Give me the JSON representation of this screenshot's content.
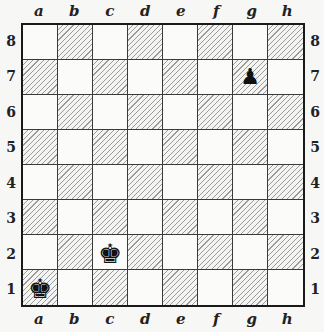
{
  "board": {
    "files": [
      "a",
      "b",
      "c",
      "d",
      "e",
      "f",
      "g",
      "h"
    ],
    "ranks_top_to_bottom": [
      "8",
      "7",
      "6",
      "5",
      "4",
      "3",
      "2",
      "1"
    ],
    "light_square_color": "#fbfbfa",
    "dark_square_style": "diagonal-hatch",
    "border_color": "#1a1a1a"
  },
  "pieces": [
    {
      "square": "g7",
      "color": "black",
      "type": "pawn",
      "glyph": "♟",
      "icon": "black-pawn-icon"
    },
    {
      "square": "c2",
      "color": "black",
      "type": "king",
      "glyph": "♚",
      "icon": "black-king-icon"
    },
    {
      "square": "a1",
      "color": "black",
      "type": "king",
      "glyph": "♚",
      "icon": "black-king-icon"
    }
  ]
}
